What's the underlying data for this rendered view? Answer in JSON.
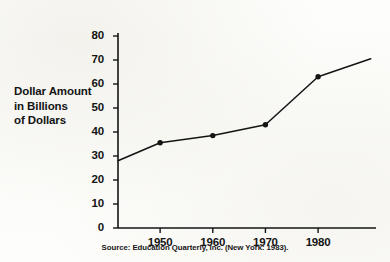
{
  "figure": {
    "axis_title_lines": [
      "Dollar Amount",
      "in Billions",
      "of Dollars"
    ],
    "source_note": "Source:  Education Quarterly, Inc. (New York: 1983).",
    "ink_color": "#141414",
    "paper_color": "#fdfdfb"
  },
  "chart_data": {
    "type": "line",
    "title": "",
    "xlabel": "",
    "ylabel": "Dollar Amount in Billions of Dollars",
    "x": [
      1950,
      1960,
      1970,
      1980
    ],
    "values": [
      35.5,
      38.5,
      43,
      63
    ],
    "series": [
      {
        "name": "Dollar Amount in Billions of Dollars",
        "values": [
          35.5,
          38.5,
          43,
          63
        ]
      }
    ],
    "line_extension": {
      "left_endpoint": {
        "x": 1942,
        "y": 28
      },
      "right_endpoint": {
        "x": 1990,
        "y": 70.5
      }
    },
    "xlim": [
      1942,
      1991
    ],
    "ylim": [
      0,
      84
    ],
    "xticks": [
      1950,
      1960,
      1970,
      1980
    ],
    "xtick_labels": [
      "1950",
      "1960",
      "1970",
      "1980"
    ],
    "yticks": [
      0,
      10,
      20,
      30,
      40,
      50,
      60,
      70,
      80
    ],
    "ytick_labels": [
      "0",
      "10",
      "20",
      "30",
      "40",
      "50",
      "60",
      "70",
      "80"
    ],
    "grid": false,
    "legend": false,
    "markers": "filled-circle",
    "line_color": "#141414"
  }
}
